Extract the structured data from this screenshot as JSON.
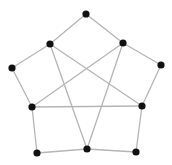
{
  "diagram": {
    "canvas": {
      "width": 172,
      "height": 165
    },
    "style": {
      "node_color": "#111111",
      "edge_color": "#b5b5b5",
      "background": "#ffffff",
      "node_radius": 3.6,
      "edge_width": 1.3
    },
    "nodes": [
      {
        "id": "top",
        "x": 86,
        "y": 14
      },
      {
        "id": "upper-left",
        "x": 50,
        "y": 44
      },
      {
        "id": "upper-right",
        "x": 123,
        "y": 43
      },
      {
        "id": "far-left",
        "x": 12,
        "y": 68
      },
      {
        "id": "far-right",
        "x": 161,
        "y": 65
      },
      {
        "id": "mid-left",
        "x": 32,
        "y": 107
      },
      {
        "id": "mid-right",
        "x": 142,
        "y": 106
      },
      {
        "id": "bottom-left",
        "x": 37,
        "y": 153
      },
      {
        "id": "bottom-center",
        "x": 87,
        "y": 149
      },
      {
        "id": "bottom-right",
        "x": 136,
        "y": 152
      }
    ],
    "edges": [
      [
        "top",
        "upper-left"
      ],
      [
        "upper-left",
        "far-left"
      ],
      [
        "far-left",
        "mid-left"
      ],
      [
        "mid-left",
        "bottom-left"
      ],
      [
        "bottom-left",
        "bottom-center"
      ],
      [
        "bottom-center",
        "bottom-right"
      ],
      [
        "bottom-right",
        "mid-right"
      ],
      [
        "mid-right",
        "far-right"
      ],
      [
        "far-right",
        "upper-right"
      ],
      [
        "upper-right",
        "top"
      ],
      [
        "upper-left",
        "mid-right"
      ],
      [
        "upper-left",
        "bottom-center"
      ],
      [
        "upper-right",
        "mid-left"
      ],
      [
        "upper-right",
        "bottom-center"
      ],
      [
        "mid-left",
        "mid-right"
      ]
    ]
  }
}
